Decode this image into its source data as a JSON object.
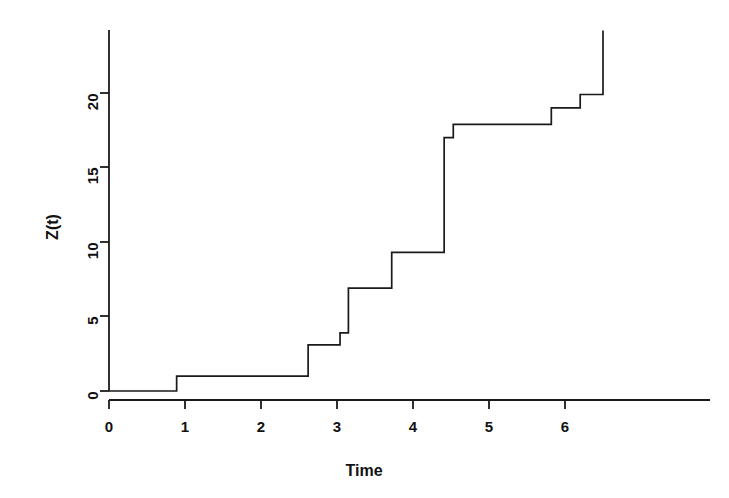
{
  "chart_data": {
    "type": "line",
    "subtype": "step-function",
    "title": "",
    "xlabel": "Time",
    "ylabel": "Z(t)",
    "xlim": [
      -0.15,
      6.7
    ],
    "ylim": [
      -0.6,
      24.4
    ],
    "xticks": [
      0,
      1,
      2,
      3,
      4,
      5,
      6
    ],
    "xtick_labels": [
      "0",
      "1",
      "2",
      "3",
      "4",
      "5",
      "6"
    ],
    "yticks": [
      0,
      5,
      10,
      15,
      20
    ],
    "ytick_labels": [
      "0",
      "5",
      "10",
      "15",
      "20"
    ],
    "grid": false,
    "legend": false,
    "line_color": "#1a1a1a",
    "line_width": 1.6,
    "axis_color": "#1a1a1a",
    "background": "#ffffff",
    "step_points": [
      {
        "t": 0.0,
        "z": 0.0
      },
      {
        "t": 0.89,
        "z": 0.0
      },
      {
        "t": 0.89,
        "z": 1.0
      },
      {
        "t": 2.62,
        "z": 1.0
      },
      {
        "t": 2.62,
        "z": 3.1
      },
      {
        "t": 3.04,
        "z": 3.1
      },
      {
        "t": 3.04,
        "z": 3.9
      },
      {
        "t": 3.15,
        "z": 3.9
      },
      {
        "t": 3.15,
        "z": 6.9
      },
      {
        "t": 3.72,
        "z": 6.9
      },
      {
        "t": 3.72,
        "z": 9.3
      },
      {
        "t": 4.41,
        "z": 9.3
      },
      {
        "t": 4.41,
        "z": 17.0
      },
      {
        "t": 4.53,
        "z": 17.0
      },
      {
        "t": 4.53,
        "z": 17.9
      },
      {
        "t": 5.82,
        "z": 17.9
      },
      {
        "t": 5.82,
        "z": 19.0
      },
      {
        "t": 6.2,
        "z": 19.0
      },
      {
        "t": 6.2,
        "z": 19.9
      },
      {
        "t": 6.5,
        "z": 19.9
      },
      {
        "t": 6.5,
        "z": 24.2
      }
    ],
    "jump_times": [
      0.89,
      2.62,
      3.04,
      3.15,
      3.72,
      4.41,
      4.53,
      5.82,
      6.2,
      6.5
    ],
    "jump_sizes": [
      1.0,
      2.1,
      0.8,
      3.0,
      2.4,
      7.7,
      0.9,
      1.1,
      0.9,
      4.3
    ],
    "levels": [
      0.0,
      1.0,
      3.1,
      3.9,
      6.9,
      9.3,
      17.0,
      17.9,
      19.0,
      19.9,
      24.2
    ]
  }
}
